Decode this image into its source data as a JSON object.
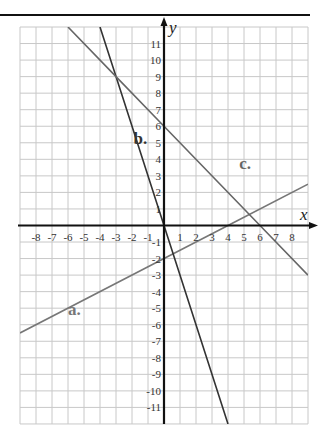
{
  "chart_data": {
    "type": "line",
    "title": "",
    "xlabel": "x",
    "ylabel": "y",
    "xlim": [
      -9,
      9
    ],
    "ylim": [
      -12,
      12
    ],
    "grid": true,
    "x_ticks": [
      -8,
      -7,
      -6,
      -5,
      -4,
      -3,
      -2,
      -1,
      1,
      2,
      3,
      4,
      5,
      6,
      7,
      8
    ],
    "y_ticks": [
      -11,
      -10,
      -9,
      -8,
      -7,
      -6,
      -5,
      -4,
      -3,
      -2,
      -1,
      1,
      2,
      3,
      4,
      5,
      6,
      7,
      8,
      9,
      10,
      11
    ],
    "series": [
      {
        "name": "a.",
        "equation": "y = 0.5x - 2",
        "points": [
          [
            -9,
            -6.5
          ],
          [
            0,
            -2
          ],
          [
            4,
            0
          ],
          [
            9,
            2.5
          ]
        ],
        "color": "#777777",
        "label_pos": [
          -6,
          -5.4
        ]
      },
      {
        "name": "b.",
        "equation": "y = -3x",
        "points": [
          [
            -4,
            12
          ],
          [
            -3,
            9
          ],
          [
            0,
            0
          ],
          [
            4,
            -12
          ]
        ],
        "color": "#333333",
        "label_pos": [
          -1.9,
          4.9
        ]
      },
      {
        "name": "c.",
        "equation": "y = -x + 6",
        "points": [
          [
            -6,
            12
          ],
          [
            -3,
            9
          ],
          [
            0,
            6
          ],
          [
            6,
            0
          ],
          [
            9,
            -3
          ]
        ],
        "color": "#666666",
        "label_pos": [
          4.7,
          3.4
        ]
      }
    ]
  },
  "labels": {
    "x_axis": "x",
    "y_axis": "y"
  }
}
